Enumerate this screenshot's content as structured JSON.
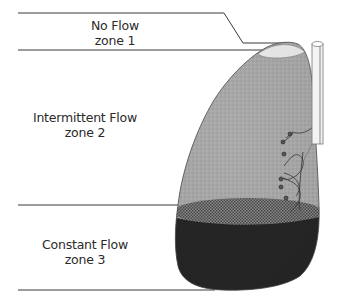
{
  "diagram": {
    "title": "",
    "zones": [
      {
        "name": "No Flow",
        "zone": "zone 1"
      },
      {
        "name": "Intermittent Flow",
        "zone": "zone 2"
      },
      {
        "name": "Constant Flow",
        "zone": "zone 3"
      }
    ],
    "elements": {
      "organ": "lung",
      "instrument": "vertical tube"
    },
    "colors": {
      "zone1_fill": "#e6e6e6",
      "zone2_fill": "#a8a8a8",
      "zone3_fill": "#262626",
      "line": "#3a3a3a"
    }
  }
}
